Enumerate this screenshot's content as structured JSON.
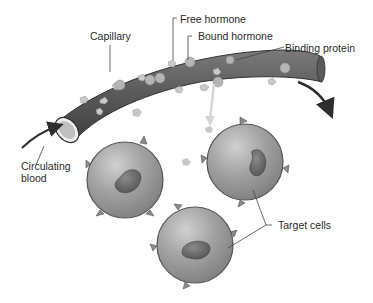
{
  "diagram": {
    "type": "biology-illustration",
    "labels": {
      "capillary": "Capillary",
      "free_hormone": "Free hormone",
      "bound_hormone": "Bound hormone",
      "binding_protein": "Binding protein",
      "circulating_blood_1": "Circulating",
      "circulating_blood_2": "blood",
      "target_cells": "Target cells"
    },
    "colors": {
      "vessel": "#5a5a5a",
      "cell": "#9a9a9a",
      "nucleus": "#6a6a6a",
      "hormone": "#c8c8c8",
      "arrow": "#333333"
    },
    "cells": [
      {
        "name": "target-cell-left",
        "cx": 125,
        "cy": 180,
        "r": 38
      },
      {
        "name": "target-cell-right",
        "cx": 245,
        "cy": 162,
        "r": 38
      },
      {
        "name": "target-cell-bottom",
        "cx": 195,
        "cy": 245,
        "r": 38
      }
    ]
  }
}
